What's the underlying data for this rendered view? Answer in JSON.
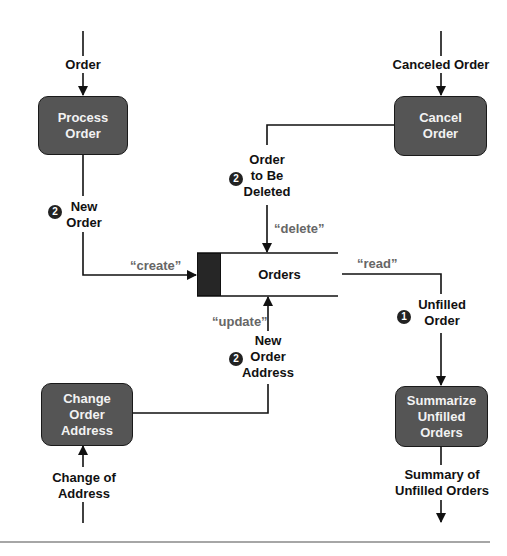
{
  "diagram": {
    "type": "data-flow-diagram",
    "processes": [
      {
        "id": "process_order",
        "label": "Process\nOrder"
      },
      {
        "id": "cancel_order",
        "label": "Cancel\nOrder"
      },
      {
        "id": "change_order_address",
        "label": "Change\nOrder\nAddress"
      },
      {
        "id": "summarize_unfilled_orders",
        "label": "Summarize\nUnfilled\nOrders"
      }
    ],
    "data_store": {
      "label": "Orders"
    },
    "flows": {
      "order_in": "Order",
      "canceled_order_in": "Canceled Order",
      "new_order": "New\nOrder",
      "order_to_be_deleted": "Order\nto Be\nDeleted",
      "new_order_address": "New\nOrder\nAddress",
      "unfilled_order": "Unfilled\nOrder",
      "change_of_address_in": "Change of Address",
      "summary_out": "Summary of\nUnfilled Orders"
    },
    "operations": {
      "create": "“create”",
      "delete": "“delete”",
      "update": "“update”",
      "read": "“read”"
    },
    "badges": {
      "new_order": "2",
      "order_to_be_deleted": "2",
      "new_order_address": "2",
      "unfilled_order": "1"
    }
  }
}
